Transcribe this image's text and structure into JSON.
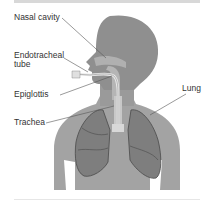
{
  "figure": {
    "labels": {
      "nasal_cavity": "Nasal cavity",
      "endotracheal_tube_line1": "Endotracheal",
      "endotracheal_tube_line2": "tube",
      "epiglottis": "Epiglottis",
      "trachea": "Trachea",
      "lung": "Lung"
    },
    "colors": {
      "body": "#a3a3a3",
      "head_dark": "#8f8f8f",
      "lung": "#7e7e7e",
      "lung_outline": "#4a4a4a",
      "tube": "#e8e8e8",
      "leader_line": "#555555"
    }
  }
}
